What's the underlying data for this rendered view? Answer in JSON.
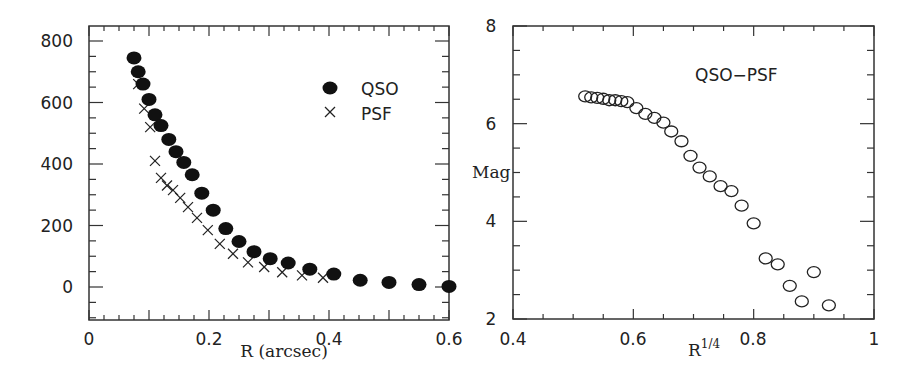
{
  "chart_data": [
    {
      "type": "scatter",
      "title": "",
      "xlabel": "R (arcsec)",
      "ylabel": "",
      "xlim": [
        0,
        0.6
      ],
      "ylim": [
        -100,
        850
      ],
      "xticks": [
        "0",
        "0.2",
        "0.4",
        "0.6"
      ],
      "yticks": [
        "0",
        "200",
        "400",
        "600",
        "800"
      ],
      "grid": false,
      "legend_position": "upper right",
      "series": [
        {
          "name": "QSO",
          "marker": "filled-circle",
          "x": [
            0.075,
            0.082,
            0.09,
            0.1,
            0.11,
            0.12,
            0.133,
            0.145,
            0.158,
            0.172,
            0.188,
            0.207,
            0.228,
            0.25,
            0.275,
            0.302,
            0.332,
            0.368,
            0.408,
            0.452,
            0.5,
            0.55,
            0.6
          ],
          "y": [
            745,
            700,
            660,
            610,
            560,
            525,
            480,
            440,
            405,
            365,
            305,
            250,
            190,
            148,
            115,
            92,
            78,
            58,
            42,
            22,
            15,
            8,
            2
          ]
        },
        {
          "name": "PSF",
          "marker": "cross",
          "x": [
            0.082,
            0.092,
            0.102,
            0.11,
            0.12,
            0.13,
            0.14,
            0.152,
            0.165,
            0.18,
            0.198,
            0.218,
            0.24,
            0.265,
            0.292,
            0.322,
            0.355,
            0.39
          ],
          "y": [
            660,
            580,
            520,
            410,
            355,
            330,
            315,
            290,
            260,
            225,
            185,
            140,
            108,
            80,
            65,
            48,
            38,
            30
          ]
        }
      ]
    },
    {
      "type": "scatter",
      "title": "QSO-PSF",
      "xlabel": "R^1/4",
      "xlabel_base": "R",
      "xlabel_sup": "1/4",
      "ylabel": "Mag",
      "xlim": [
        0.4,
        1.0
      ],
      "ylim": [
        2,
        8
      ],
      "xticks": [
        "0.4",
        "0.6",
        "0.8",
        "1"
      ],
      "yticks": [
        "2",
        "4",
        "6",
        "8"
      ],
      "grid": false,
      "series": [
        {
          "name": "QSO-PSF",
          "marker": "open-circle",
          "x": [
            0.52,
            0.53,
            0.54,
            0.55,
            0.56,
            0.57,
            0.58,
            0.59,
            0.605,
            0.62,
            0.635,
            0.65,
            0.663,
            0.68,
            0.695,
            0.71,
            0.727,
            0.745,
            0.763,
            0.78,
            0.8,
            0.82,
            0.84,
            0.86,
            0.88,
            0.9,
            0.925
          ],
          "y": [
            6.56,
            6.54,
            6.53,
            6.51,
            6.48,
            6.48,
            6.46,
            6.44,
            6.32,
            6.2,
            6.12,
            6.02,
            5.84,
            5.64,
            5.34,
            5.1,
            4.92,
            4.72,
            4.62,
            4.32,
            3.96,
            3.24,
            3.12,
            2.68,
            2.36,
            2.96,
            2.28
          ]
        }
      ]
    }
  ],
  "left_plot": {
    "xlabel": "R (arcsec)",
    "legend": {
      "qso": "QSO",
      "psf": "PSF"
    },
    "xticks": [
      "0",
      "0.2",
      "0.4",
      "0.6"
    ],
    "yticks": [
      "0",
      "200",
      "400",
      "600",
      "800"
    ]
  },
  "right_plot": {
    "annotation": "QSO−PSF",
    "ylabel": "Mag",
    "xlabel_base": "R",
    "xlabel_sup": "1/4",
    "xticks": [
      "0.4",
      "0.6",
      "0.8",
      "1"
    ],
    "yticks": [
      "2",
      "4",
      "6",
      "8"
    ]
  }
}
